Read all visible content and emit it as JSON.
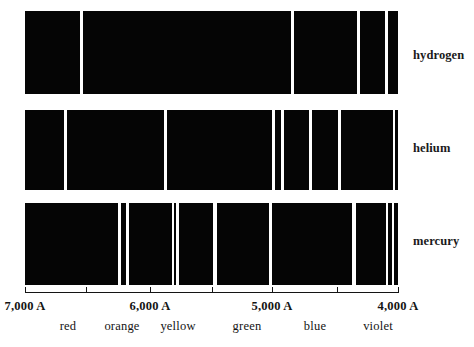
{
  "figure": {
    "width": 474,
    "height": 347,
    "background_color": "#ffffff",
    "spectrum_fill_color": "#050505",
    "line_color": "#ffffff",
    "text_color": "#141414"
  },
  "chart_data": {
    "type": "bar",
    "xlabel": "wavelength",
    "ylabel": "",
    "grid": false,
    "legend_position": "right",
    "x_axis": {
      "orientation": "horizontal",
      "direction": "decreasing",
      "unit": "A",
      "range_start": 7000,
      "range_end": 4000,
      "pixel_start": 25,
      "pixel_end": 398,
      "ticks": [
        {
          "label": "7,000 A",
          "value": 7000,
          "x": 25
        },
        {
          "label": "",
          "value": 6500,
          "x": 86
        },
        {
          "label": "6,000 A",
          "value": 6000,
          "x": 150
        },
        {
          "label": "",
          "value": 5500,
          "x": 212
        },
        {
          "label": "5,000 A",
          "value": 5000,
          "x": 272
        },
        {
          "label": "",
          "value": 4500,
          "x": 337
        },
        {
          "label": "4,000 A",
          "value": 4000,
          "x": 398
        }
      ],
      "tick_labels": [
        "7,000 A",
        "6,000 A",
        "5,000 A",
        "4,000 A"
      ]
    },
    "color_bands": [
      {
        "name": "red",
        "x": 68,
        "center_wavelength": 6650
      },
      {
        "name": "orange",
        "x": 122,
        "center_wavelength": 6220
      },
      {
        "name": "yellow",
        "x": 178,
        "center_wavelength": 5780
      },
      {
        "name": "green",
        "x": 247,
        "center_wavelength": 5230
      },
      {
        "name": "blue",
        "x": 315,
        "center_wavelength": 4690
      },
      {
        "name": "violet",
        "x": 378,
        "center_wavelength": 4160
      }
    ],
    "categories": [
      "hydrogen",
      "helium",
      "mercury"
    ],
    "series": [
      {
        "name": "hydrogen",
        "label": "hydrogen",
        "bar_top": 11,
        "bar_height": 83,
        "bar_left": 25,
        "bar_right": 398,
        "lines": [
          {
            "x": 80,
            "width": 3,
            "wavelength": 6560
          },
          {
            "x": 291,
            "width": 3,
            "wavelength": 4860
          },
          {
            "x": 357,
            "width": 3,
            "wavelength": 4340
          },
          {
            "x": 385,
            "width": 3,
            "wavelength": 4100
          }
        ],
        "line_count": 4
      },
      {
        "name": "helium",
        "label": "helium",
        "bar_top": 110,
        "bar_height": 80,
        "bar_left": 25,
        "bar_right": 398,
        "lines": [
          {
            "x": 64,
            "width": 3,
            "wavelength": 6680
          },
          {
            "x": 164,
            "width": 3,
            "wavelength": 5880
          },
          {
            "x": 272,
            "width": 3,
            "wavelength": 5020
          },
          {
            "x": 281,
            "width": 3,
            "wavelength": 4920
          },
          {
            "x": 309,
            "width": 3,
            "wavelength": 4710
          },
          {
            "x": 338,
            "width": 3,
            "wavelength": 4470
          },
          {
            "x": 393,
            "width": 2,
            "wavelength": 4030
          }
        ],
        "line_count": 7
      },
      {
        "name": "mercury",
        "label": "mercury",
        "bar_top": 203,
        "bar_height": 82,
        "bar_left": 25,
        "bar_right": 398,
        "lines": [
          {
            "x": 118,
            "width": 3,
            "wavelength": 6230
          },
          {
            "x": 126,
            "width": 3,
            "wavelength": 6150
          },
          {
            "x": 172,
            "width": 2,
            "wavelength": 5790
          },
          {
            "x": 176,
            "width": 3,
            "wavelength": 5770
          },
          {
            "x": 213,
            "width": 4,
            "wavelength": 5460
          },
          {
            "x": 269,
            "width": 3,
            "wavelength": 4920
          },
          {
            "x": 352,
            "width": 4,
            "wavelength": 4360
          },
          {
            "x": 386,
            "width": 2,
            "wavelength": 4080
          },
          {
            "x": 392,
            "width": 2,
            "wavelength": 4050
          }
        ],
        "line_count": 9
      }
    ]
  },
  "row_labels": [
    {
      "text": "hydrogen",
      "x": 413,
      "y": 48
    },
    {
      "text": "helium",
      "x": 413,
      "y": 141
    },
    {
      "text": "mercury",
      "x": 413,
      "y": 234
    }
  ]
}
